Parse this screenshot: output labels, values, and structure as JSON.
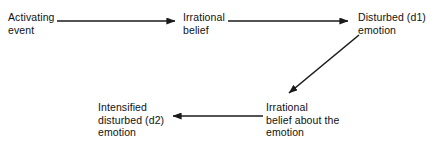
{
  "diagram": {
    "background_color": "#ffffff",
    "line_color": "#1a1a1a",
    "text_color": "#111111",
    "nodes": [
      {
        "id": "activating-event",
        "label": "Activating\nevent"
      },
      {
        "id": "irrational-belief",
        "label": "Irrational\nbelief"
      },
      {
        "id": "disturbed-emotion",
        "label": "Disturbed (d1)\nemotion"
      },
      {
        "id": "irrational-belief-emotion",
        "label": "Irrational\nbelief about the\nemotion"
      },
      {
        "id": "intensified-emotion",
        "label": "Intensified\ndisturbed (d2)\nemotion"
      }
    ],
    "connectors": [
      {
        "id": "arrow-activating-to-belief",
        "from": "activating-event",
        "to": "irrational-belief",
        "direction": "right"
      },
      {
        "id": "arrow-belief-to-disturbed",
        "from": "irrational-belief",
        "to": "disturbed-emotion",
        "direction": "right"
      },
      {
        "id": "arrow-disturbed-to-belief-emotion",
        "from": "disturbed-emotion",
        "to": "irrational-belief-emotion",
        "direction": "down-left"
      },
      {
        "id": "arrow-belief-emotion-to-intensified",
        "from": "irrational-belief-emotion",
        "to": "intensified-emotion",
        "direction": "left"
      }
    ]
  }
}
